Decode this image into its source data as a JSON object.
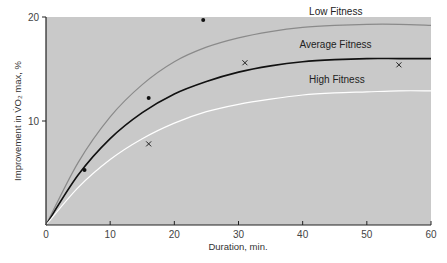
{
  "chart_data": {
    "type": "line",
    "title": "",
    "xlabel": "Duration, min.",
    "ylabel": "Improvement in V̇O₂ max, %",
    "xlim": [
      0,
      60
    ],
    "ylim": [
      0,
      20
    ],
    "x_ticks": [
      0,
      10,
      20,
      30,
      40,
      50,
      60
    ],
    "y_ticks": [
      10,
      20
    ],
    "grid": false,
    "legend_position": "inline labels",
    "background": "#c9c9c9",
    "series": [
      {
        "name": "Low Fitness",
        "color": "#8a8a8a",
        "x": [
          0,
          5,
          10,
          15,
          20,
          25,
          30,
          35,
          40,
          45,
          50,
          55,
          60
        ],
        "values": [
          0,
          6.0,
          10.4,
          13.5,
          15.7,
          17.1,
          18.0,
          18.6,
          19.0,
          19.2,
          19.3,
          19.3,
          19.2
        ]
      },
      {
        "name": "Average Fitness",
        "color": "#111111",
        "x": [
          0,
          5,
          10,
          15,
          20,
          25,
          30,
          35,
          40,
          45,
          50,
          55,
          60
        ],
        "values": [
          0,
          4.8,
          8.3,
          10.8,
          12.6,
          13.8,
          14.7,
          15.3,
          15.7,
          15.9,
          16.0,
          16.0,
          16.0
        ]
      },
      {
        "name": "High Fitness",
        "color": "#ffffff",
        "x": [
          0,
          5,
          10,
          15,
          20,
          25,
          30,
          35,
          40,
          45,
          50,
          55,
          60
        ],
        "values": [
          0,
          3.6,
          6.3,
          8.3,
          9.8,
          10.9,
          11.6,
          12.1,
          12.5,
          12.7,
          12.8,
          12.9,
          12.9
        ]
      }
    ],
    "points": [
      {
        "marker": "dot",
        "x": 6,
        "y": 5.3
      },
      {
        "marker": "dot",
        "x": 16,
        "y": 12.2
      },
      {
        "marker": "dot",
        "x": 24.5,
        "y": 19.7
      },
      {
        "marker": "cross",
        "x": 16,
        "y": 7.8
      },
      {
        "marker": "cross",
        "x": 31,
        "y": 15.6
      },
      {
        "marker": "cross",
        "x": 55,
        "y": 15.4
      }
    ],
    "annotations": [
      {
        "text": "Low Fitness",
        "x": 41,
        "y": 20.2
      },
      {
        "text": "Average Fitness",
        "x": 39.5,
        "y": 17.0
      },
      {
        "text": "High Fitness",
        "x": 41,
        "y": 13.7
      }
    ]
  }
}
